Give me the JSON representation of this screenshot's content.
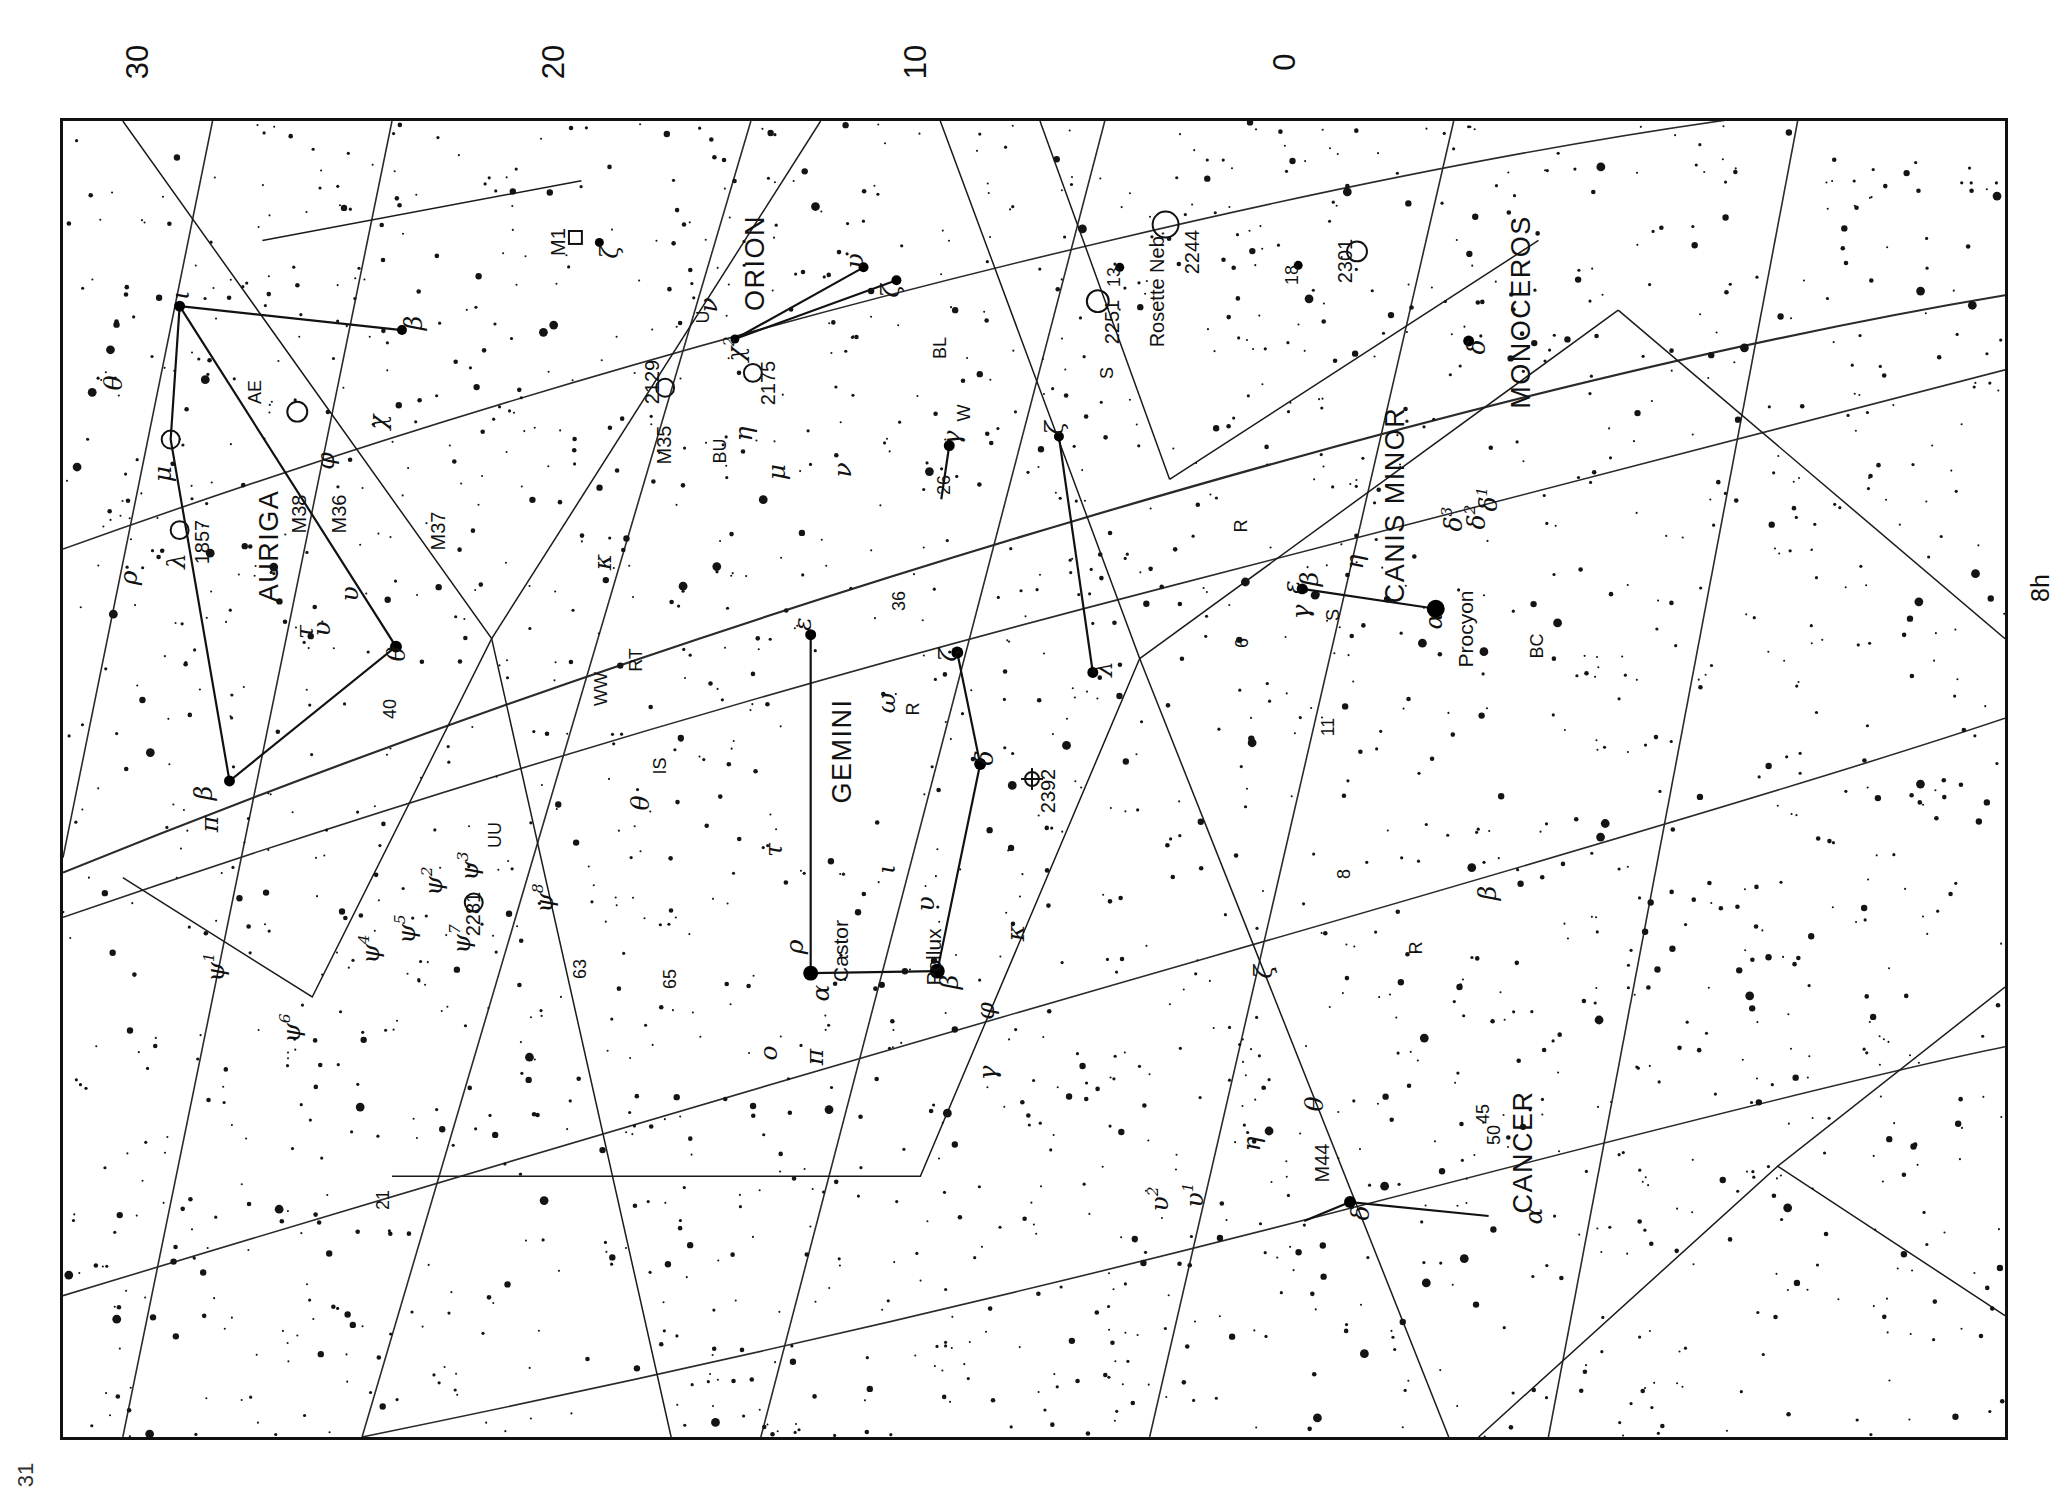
{
  "chart_data": {
    "type": "scatter",
    "orientation": "rotated-90-ccw",
    "xlabel": "Right Ascension (h)",
    "ylabel": "Declination (deg)",
    "grid": true,
    "declination_ticks": [
      "30",
      "20",
      "10",
      "0"
    ],
    "ra_ticks": [
      "8h"
    ],
    "page_number": "31",
    "constellations": [
      "AURIGA",
      "GEMINI",
      "ORION",
      "MONOCEROS",
      "CANIS MINOR",
      "CANCER"
    ],
    "named_stars": [
      "Procyon",
      "Castor",
      "Pollux"
    ],
    "deep_sky_objects": [
      "M1",
      "M35",
      "M36",
      "M37",
      "M38",
      "M44",
      "1857",
      "2129",
      "2175",
      "2244",
      "2281",
      "2301",
      "2392",
      "Rosette Neb.",
      "2251"
    ]
  },
  "page": {
    "number": "31"
  },
  "axis": {
    "declination": [
      {
        "label": "30",
        "x": 138,
        "y": 62
      },
      {
        "label": "20",
        "x": 554,
        "y": 62
      },
      {
        "label": "10",
        "x": 916,
        "y": 62
      },
      {
        "label": "0",
        "x": 1285,
        "y": 62
      }
    ],
    "ra": [
      {
        "label": "8h",
        "x": 2040,
        "y": 588
      }
    ]
  },
  "constellation_names": [
    {
      "name": "AURIGA",
      "x": 206,
      "y": 425
    },
    {
      "name": "GEMINI",
      "x": 779,
      "y": 630
    },
    {
      "name": "ORION",
      "x": 692,
      "y": 142
    },
    {
      "name": "MONOCEROS",
      "x": 1458,
      "y": 191
    },
    {
      "name": "CANIS MINOR",
      "x": 1332,
      "y": 384
    },
    {
      "name": "CANCER",
      "x": 1460,
      "y": 1031
    }
  ],
  "named_star_labels": [
    {
      "name": "Procyon",
      "x": 1402,
      "y": 508
    },
    {
      "name": "Castor",
      "x": 777,
      "y": 830
    },
    {
      "name": "Pollux",
      "x": 870,
      "y": 836
    }
  ],
  "dso_labels": [
    {
      "name": "M1",
      "x": 495,
      "y": 121
    },
    {
      "name": "M35",
      "x": 601,
      "y": 324
    },
    {
      "name": "M36",
      "x": 276,
      "y": 393
    },
    {
      "name": "M37",
      "x": 375,
      "y": 410
    },
    {
      "name": "M38",
      "x": 236,
      "y": 393
    },
    {
      "name": "M44",
      "x": 1259,
      "y": 1042
    },
    {
      "name": "1857",
      "x": 139,
      "y": 421
    },
    {
      "name": "2129",
      "x": 589,
      "y": 261
    },
    {
      "name": "2175",
      "x": 705,
      "y": 262
    },
    {
      "name": "2244",
      "x": 1129,
      "y": 131
    },
    {
      "name": "2251",
      "x": 1049,
      "y": 201
    },
    {
      "name": "2281",
      "x": 410,
      "y": 793
    },
    {
      "name": "2301",
      "x": 1282,
      "y": 140
    },
    {
      "name": "2392",
      "x": 985,
      "y": 670
    },
    {
      "name": "Rosette Neb.",
      "x": 1094,
      "y": 168
    }
  ],
  "star_labels": [
    {
      "t": "ι",
      "x": 117,
      "y": 174,
      "g": true
    },
    {
      "t": "β",
      "x": 350,
      "y": 202,
      "g": true
    },
    {
      "t": "ζ",
      "x": 546,
      "y": 131,
      "g": true
    },
    {
      "t": "υ",
      "x": 791,
      "y": 140,
      "g": true
    },
    {
      "t": "ζ",
      "x": 827,
      "y": 170,
      "g": true
    },
    {
      "t": "ν",
      "x": 645,
      "y": 184,
      "g": true
    },
    {
      "t": "U",
      "x": 640,
      "y": 196,
      "g": false
    },
    {
      "t": "χ",
      "x": 672,
      "y": 228,
      "g": true,
      "sup": "2"
    },
    {
      "t": "δ",
      "x": 1413,
      "y": 226,
      "g": true
    },
    {
      "t": "13",
      "x": 1051,
      "y": 156,
      "g": false
    },
    {
      "t": "18",
      "x": 1229,
      "y": 154,
      "g": false
    },
    {
      "t": "BL",
      "x": 877,
      "y": 227,
      "g": false
    },
    {
      "t": "S",
      "x": 1044,
      "y": 252,
      "g": false
    },
    {
      "t": "AE",
      "x": 192,
      "y": 271,
      "g": false
    },
    {
      "t": "θ",
      "x": 50,
      "y": 262,
      "g": true
    },
    {
      "t": "χ",
      "x": 314,
      "y": 301,
      "g": true
    },
    {
      "t": "φ",
      "x": 262,
      "y": 340,
      "g": true
    },
    {
      "t": "μ",
      "x": 99,
      "y": 353,
      "g": true
    },
    {
      "t": "η",
      "x": 680,
      "y": 313,
      "g": true
    },
    {
      "t": "BU",
      "x": 657,
      "y": 330,
      "g": false
    },
    {
      "t": "μ",
      "x": 713,
      "y": 351,
      "g": true
    },
    {
      "t": "ν",
      "x": 779,
      "y": 349,
      "g": true
    },
    {
      "t": "γ",
      "x": 888,
      "y": 317,
      "g": true
    },
    {
      "t": "W",
      "x": 901,
      "y": 292,
      "g": false
    },
    {
      "t": "ζ",
      "x": 991,
      "y": 307,
      "g": true
    },
    {
      "t": "δ",
      "x": 1425,
      "y": 378,
      "g": true,
      "sup": "1"
    },
    {
      "t": "λ",
      "x": 113,
      "y": 440,
      "g": true
    },
    {
      "t": "ρ",
      "x": 65,
      "y": 457,
      "g": true
    },
    {
      "t": "υ",
      "x": 286,
      "y": 473,
      "g": true
    },
    {
      "t": "κ",
      "x": 539,
      "y": 441,
      "g": true
    },
    {
      "t": "26",
      "x": 881,
      "y": 364,
      "g": false
    },
    {
      "t": "36",
      "x": 836,
      "y": 480,
      "g": false
    },
    {
      "t": "ε",
      "x": 739,
      "y": 503,
      "g": true
    },
    {
      "t": "R",
      "x": 1178,
      "y": 405,
      "g": false
    },
    {
      "t": "η",
      "x": 1291,
      "y": 441,
      "g": true
    },
    {
      "t": "β",
      "x": 1246,
      "y": 458,
      "g": true
    },
    {
      "t": "ε",
      "x": 1228,
      "y": 466,
      "g": true
    },
    {
      "t": "γ",
      "x": 1237,
      "y": 491,
      "g": true
    },
    {
      "t": "S",
      "x": 1270,
      "y": 494,
      "g": false
    },
    {
      "t": "α",
      "x": 1370,
      "y": 500,
      "g": true
    },
    {
      "t": "δ",
      "x": 1390,
      "y": 398,
      "g": true,
      "sup": "3"
    },
    {
      "t": "δ",
      "x": 1413,
      "y": 396,
      "g": true,
      "sup": "2"
    },
    {
      "t": "τ",
      "x": 241,
      "y": 511,
      "g": true
    },
    {
      "t": "υ",
      "x": 258,
      "y": 508,
      "g": true
    },
    {
      "t": "θ",
      "x": 333,
      "y": 533,
      "g": true
    },
    {
      "t": "RT",
      "x": 573,
      "y": 539,
      "g": false
    },
    {
      "t": "WW",
      "x": 538,
      "y": 568,
      "g": false
    },
    {
      "t": "ζ",
      "x": 885,
      "y": 534,
      "g": true
    },
    {
      "t": "λ",
      "x": 1040,
      "y": 548,
      "g": true
    },
    {
      "t": "BC",
      "x": 1474,
      "y": 525,
      "g": false
    },
    {
      "t": "6",
      "x": 1179,
      "y": 522,
      "g": false
    },
    {
      "t": "40",
      "x": 327,
      "y": 588,
      "g": false
    },
    {
      "t": "ω",
      "x": 823,
      "y": 582,
      "g": true
    },
    {
      "t": "R",
      "x": 850,
      "y": 588,
      "g": false
    },
    {
      "t": "11",
      "x": 1265,
      "y": 606,
      "g": false
    },
    {
      "t": "IS",
      "x": 597,
      "y": 645,
      "g": false
    },
    {
      "t": "δ",
      "x": 921,
      "y": 637,
      "g": true
    },
    {
      "t": "θ",
      "x": 577,
      "y": 682,
      "g": true
    },
    {
      "t": "β",
      "x": 140,
      "y": 672,
      "g": true
    },
    {
      "t": "π",
      "x": 146,
      "y": 703,
      "g": true
    },
    {
      "t": "UU",
      "x": 432,
      "y": 714,
      "g": false
    },
    {
      "t": "τ",
      "x": 710,
      "y": 729,
      "g": true
    },
    {
      "t": "ψ",
      "x": 406,
      "y": 745,
      "g": true,
      "sup": "3"
    },
    {
      "t": "ψ",
      "x": 370,
      "y": 760,
      "g": true,
      "sup": "2"
    },
    {
      "t": "ψ",
      "x": 481,
      "y": 777,
      "g": true,
      "sup": "8"
    },
    {
      "t": "ι",
      "x": 823,
      "y": 748,
      "g": true
    },
    {
      "t": "8",
      "x": 1281,
      "y": 753,
      "g": false
    },
    {
      "t": "β",
      "x": 1424,
      "y": 772,
      "g": true
    },
    {
      "t": "ψ",
      "x": 343,
      "y": 808,
      "g": true,
      "sup": "5"
    },
    {
      "t": "ψ",
      "x": 398,
      "y": 818,
      "g": true,
      "sup": "7"
    },
    {
      "t": "ψ",
      "x": 307,
      "y": 828,
      "g": true,
      "sup": "4"
    },
    {
      "t": "υ",
      "x": 862,
      "y": 783,
      "g": true
    },
    {
      "t": "κ",
      "x": 952,
      "y": 812,
      "g": true
    },
    {
      "t": "R",
      "x": 1353,
      "y": 827,
      "g": false
    },
    {
      "t": "ρ",
      "x": 731,
      "y": 826,
      "g": true
    },
    {
      "t": "63",
      "x": 517,
      "y": 848,
      "g": false
    },
    {
      "t": "65",
      "x": 607,
      "y": 858,
      "g": false
    },
    {
      "t": "α",
      "x": 757,
      "y": 872,
      "g": true
    },
    {
      "t": "β",
      "x": 886,
      "y": 861,
      "g": true
    },
    {
      "t": "ψ",
      "x": 152,
      "y": 846,
      "g": true,
      "sup": "1"
    },
    {
      "t": "ψ",
      "x": 228,
      "y": 907,
      "g": true,
      "sup": "6"
    },
    {
      "t": "φ",
      "x": 922,
      "y": 890,
      "g": true
    },
    {
      "t": "ζ",
      "x": 1200,
      "y": 851,
      "g": true
    },
    {
      "t": "o",
      "x": 705,
      "y": 932,
      "g": true
    },
    {
      "t": "π",
      "x": 751,
      "y": 936,
      "g": true
    },
    {
      "t": "γ",
      "x": 924,
      "y": 952,
      "g": true
    },
    {
      "t": "θ",
      "x": 1251,
      "y": 983,
      "g": true
    },
    {
      "t": "45",
      "x": 1420,
      "y": 993,
      "g": false
    },
    {
      "t": "50",
      "x": 1431,
      "y": 1014,
      "g": false
    },
    {
      "t": "η",
      "x": 1188,
      "y": 1023,
      "g": true
    },
    {
      "t": "21",
      "x": 320,
      "y": 1079,
      "g": false
    },
    {
      "t": "υ",
      "x": 1096,
      "y": 1078,
      "g": true,
      "sup": "2"
    },
    {
      "t": "υ",
      "x": 1131,
      "y": 1074,
      "g": true,
      "sup": "1"
    },
    {
      "t": "δ",
      "x": 1297,
      "y": 1092,
      "g": true
    },
    {
      "t": "α",
      "x": 1470,
      "y": 1095,
      "g": true
    }
  ],
  "bright_stars": [
    {
      "x": 117,
      "y": 186,
      "r": 5.5
    },
    {
      "x": 340,
      "y": 210,
      "r": 5.0
    },
    {
      "x": 334,
      "y": 528,
      "r": 6.0
    },
    {
      "x": 167,
      "y": 663,
      "r": 5.5
    },
    {
      "x": 750,
      "y": 856,
      "r": 7.5
    },
    {
      "x": 877,
      "y": 854,
      "r": 7.5
    },
    {
      "x": 1377,
      "y": 490,
      "r": 9.0
    },
    {
      "x": 1243,
      "y": 470,
      "r": 5.5
    },
    {
      "x": 897,
      "y": 534,
      "r": 6.0
    },
    {
      "x": 920,
      "y": 646,
      "r": 6.0
    },
    {
      "x": 1033,
      "y": 554,
      "r": 5.5
    },
    {
      "x": 889,
      "y": 326,
      "r": 5.5
    },
    {
      "x": 999,
      "y": 317,
      "r": 5.0
    },
    {
      "x": 750,
      "y": 516,
      "r": 5.5
    },
    {
      "x": 1410,
      "y": 221,
      "r": 5.5
    },
    {
      "x": 1291,
      "y": 1086,
      "r": 6.0
    },
    {
      "x": 803,
      "y": 147,
      "r": 5.0
    },
    {
      "x": 836,
      "y": 160,
      "r": 5.0
    },
    {
      "x": 674,
      "y": 219,
      "r": 4.5
    },
    {
      "x": 538,
      "y": 122,
      "r": 4.5
    },
    {
      "x": 1239,
      "y": 145,
      "r": 4.5
    },
    {
      "x": 1060,
      "y": 147,
      "r": 4.5
    }
  ],
  "open_cluster_circles": [
    {
      "x": 235,
      "y": 292,
      "r": 10
    },
    {
      "x": 108,
      "y": 320,
      "r": 9
    },
    {
      "x": 117,
      "y": 411,
      "r": 9
    },
    {
      "x": 604,
      "y": 268,
      "r": 9
    },
    {
      "x": 692,
      "y": 253,
      "r": 9
    },
    {
      "x": 1038,
      "y": 181,
      "r": 11
    },
    {
      "x": 1106,
      "y": 104,
      "r": 13
    },
    {
      "x": 1298,
      "y": 131,
      "r": 10
    },
    {
      "x": 412,
      "y": 785,
      "r": 9
    }
  ],
  "planetary_nebulae": [
    {
      "x": 972,
      "y": 661,
      "r": 7
    }
  ],
  "nebula_squares": [
    {
      "x": 514,
      "y": 117,
      "s": 13
    }
  ],
  "constellation_lines": [
    {
      "pts": "117,186 340,210"
    },
    {
      "pts": "117,186 108,320 167,663 334,528 117,186"
    },
    {
      "pts": "750,856 877,854"
    },
    {
      "pts": "1377,490 1243,470"
    },
    {
      "pts": "897,534 920,646 877,854"
    },
    {
      "pts": "999,317 1033,554"
    },
    {
      "pts": "889,326 881,380"
    },
    {
      "pts": "803,147 674,219"
    },
    {
      "pts": "836,160 674,219"
    },
    {
      "pts": "750,516 750,856"
    },
    {
      "pts": "1291,1086 1430,1100"
    },
    {
      "pts": "1291,1086 1245,1105"
    }
  ]
}
